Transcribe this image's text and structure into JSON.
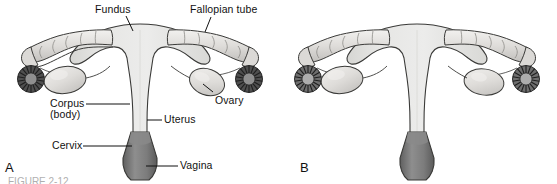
{
  "figure": {
    "caption_partial": "FIGURE 2-12",
    "panels": [
      {
        "letter": "A",
        "name": "labeled-diagram",
        "labels": [
          {
            "id": "fundus",
            "text": "Fundus"
          },
          {
            "id": "fallopian-tube",
            "text": "Fallopian tube"
          },
          {
            "id": "corpus",
            "text": "Corpus"
          },
          {
            "id": "corpus-body",
            "text": "(body)"
          },
          {
            "id": "ovary",
            "text": "Ovary"
          },
          {
            "id": "uterus",
            "text": "Uterus"
          },
          {
            "id": "cervix",
            "text": "Cervix"
          },
          {
            "id": "vagina",
            "text": "Vagina"
          }
        ]
      },
      {
        "letter": "B",
        "name": "unlabeled-diagram",
        "labels": []
      }
    ]
  },
  "colors": {
    "uterus_fill": "#e2e2e0",
    "uterus_fill_light": "#eeeeec",
    "vagina_fill": "#8c8c8c",
    "vagina_fill_dark": "#6f6f6f",
    "ovary_fill": "#dedddb",
    "tube_fill": "#d9d8d6",
    "fimbriae_fill": "#4a4a4a",
    "outline": "#2b2b2b",
    "leader_line": "#111111",
    "background": "#ffffff"
  }
}
